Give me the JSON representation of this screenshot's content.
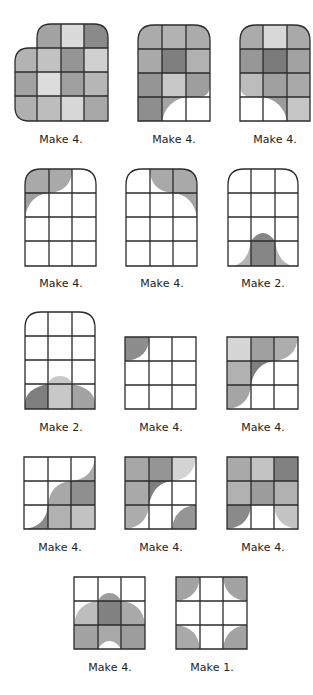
{
  "figure": {
    "colors": {
      "light": "#d8d8d8",
      "medium_light": "#bcbcbc",
      "medium": "#a9a9a9",
      "medium_dark": "#959595",
      "dark": "#7f7f7f",
      "line": "#2b2b2b",
      "background": "#ffffff"
    },
    "units": [
      {
        "id": 1,
        "shape": "heart-lobe 4x4 with rounded top-right and left lobes",
        "label": "Make 4."
      },
      {
        "id": 2,
        "shape": "3x4 arched top, bottom-right cut out with curve",
        "label": "Make 4."
      },
      {
        "id": 3,
        "shape": "3x4 arched top, bottom-left cut out with curve",
        "label": "Make 4."
      },
      {
        "id": 4,
        "shape": "3x4 arch, gray wave top-left",
        "label": "Make 4."
      },
      {
        "id": 5,
        "shape": "3x4 arch, gray wave top-right",
        "label": "Make 4."
      },
      {
        "id": 6,
        "shape": "3x4 arch, bell shape bottom-center",
        "label": "Make 2."
      },
      {
        "id": 7,
        "shape": "3x4 arch, dome along bottom row",
        "label": "Make 2."
      },
      {
        "id": 8,
        "shape": "3x3 square, quarter circle top-left",
        "label": "Make 4."
      },
      {
        "id": 9,
        "shape": "3x3 square, L-shape with curves",
        "label": "Make 4."
      },
      {
        "id": 10,
        "shape": "3x3 square, diagonal wave",
        "label": "Make 4."
      },
      {
        "id": 11,
        "shape": "3x3 square, curved arc pieces",
        "label": "Make 4."
      },
      {
        "id": 12,
        "shape": "3x3 square, arch cutout bottom-center",
        "label": "Make 4."
      },
      {
        "id": 13,
        "shape": "3x3 square, dome with center cutout",
        "label": "Make 4."
      },
      {
        "id": 14,
        "shape": "3x3 square, four corner quarter circles",
        "label": "Make 1."
      }
    ]
  }
}
